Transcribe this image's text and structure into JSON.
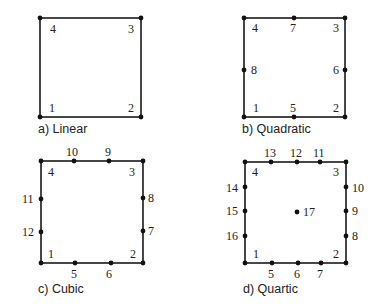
{
  "panels": [
    {
      "id": "linear",
      "caption": "a) Linear",
      "box": {
        "x1": 40,
        "y1": 18,
        "x2": 141,
        "y2": 117
      },
      "caption_pos": {
        "x": 38,
        "y": 133
      },
      "nodes": [
        {
          "label": "1",
          "x": 40,
          "y": 117,
          "lx": 49,
          "ly": 112
        },
        {
          "label": "2",
          "x": 141,
          "y": 117,
          "lx": 128,
          "ly": 112
        },
        {
          "label": "3",
          "x": 141,
          "y": 18,
          "lx": 128,
          "ly": 33
        },
        {
          "label": "4",
          "x": 40,
          "y": 18,
          "lx": 50,
          "ly": 33
        }
      ]
    },
    {
      "id": "quadratic",
      "caption": "b) Quadratic",
      "box": {
        "x1": 244,
        "y1": 18,
        "x2": 345,
        "y2": 117
      },
      "caption_pos": {
        "x": 242,
        "y": 133
      },
      "nodes": [
        {
          "label": "1",
          "x": 244,
          "y": 117,
          "lx": 253,
          "ly": 112
        },
        {
          "label": "2",
          "x": 345,
          "y": 117,
          "lx": 333,
          "ly": 112
        },
        {
          "label": "3",
          "x": 345,
          "y": 18,
          "lx": 333,
          "ly": 32
        },
        {
          "label": "4",
          "x": 244,
          "y": 18,
          "lx": 252,
          "ly": 32
        },
        {
          "label": "5",
          "x": 294,
          "y": 117,
          "lx": 290,
          "ly": 112
        },
        {
          "label": "6",
          "x": 345,
          "y": 70,
          "lx": 333,
          "ly": 74
        },
        {
          "label": "7",
          "x": 294,
          "y": 18,
          "lx": 290,
          "ly": 32
        },
        {
          "label": "8",
          "x": 244,
          "y": 70,
          "lx": 251,
          "ly": 74
        }
      ]
    },
    {
      "id": "cubic",
      "caption": "c) Cubic",
      "box": {
        "x1": 41,
        "y1": 161,
        "x2": 143,
        "y2": 263
      },
      "caption_pos": {
        "x": 38,
        "y": 293
      },
      "nodes": [
        {
          "label": "1",
          "x": 41,
          "y": 263,
          "lx": 48,
          "ly": 258
        },
        {
          "label": "2",
          "x": 143,
          "y": 263,
          "lx": 130,
          "ly": 258
        },
        {
          "label": "3",
          "x": 143,
          "y": 161,
          "lx": 129,
          "ly": 176
        },
        {
          "label": "4",
          "x": 41,
          "y": 161,
          "lx": 48,
          "ly": 176
        },
        {
          "label": "5",
          "x": 75,
          "y": 263,
          "lx": 71,
          "ly": 278
        },
        {
          "label": "6",
          "x": 111,
          "y": 263,
          "lx": 106,
          "ly": 278
        },
        {
          "label": "7",
          "x": 143,
          "y": 231,
          "lx": 148,
          "ly": 235
        },
        {
          "label": "8",
          "x": 143,
          "y": 198,
          "lx": 148,
          "ly": 202
        },
        {
          "label": "9",
          "x": 109,
          "y": 161,
          "lx": 105,
          "ly": 156
        },
        {
          "label": "10",
          "x": 74,
          "y": 161,
          "lx": 66,
          "ly": 156
        },
        {
          "label": "11",
          "x": 41,
          "y": 199,
          "lx": 22,
          "ly": 203
        },
        {
          "label": "12",
          "x": 41,
          "y": 232,
          "lx": 22,
          "ly": 236
        }
      ]
    },
    {
      "id": "quartic",
      "caption": "d) Quartic",
      "box": {
        "x1": 245,
        "y1": 162,
        "x2": 346,
        "y2": 263
      },
      "caption_pos": {
        "x": 243,
        "y": 293
      },
      "nodes": [
        {
          "label": "1",
          "x": 245,
          "y": 263,
          "lx": 253,
          "ly": 258
        },
        {
          "label": "2",
          "x": 346,
          "y": 263,
          "lx": 333,
          "ly": 258
        },
        {
          "label": "3",
          "x": 346,
          "y": 162,
          "lx": 333,
          "ly": 176
        },
        {
          "label": "4",
          "x": 245,
          "y": 162,
          "lx": 252,
          "ly": 176
        },
        {
          "label": "5",
          "x": 272,
          "y": 263,
          "lx": 268,
          "ly": 278
        },
        {
          "label": "6",
          "x": 298,
          "y": 263,
          "lx": 294,
          "ly": 278
        },
        {
          "label": "7",
          "x": 321,
          "y": 263,
          "lx": 317,
          "ly": 278
        },
        {
          "label": "8",
          "x": 346,
          "y": 236,
          "lx": 352,
          "ly": 240
        },
        {
          "label": "9",
          "x": 346,
          "y": 211,
          "lx": 352,
          "ly": 215
        },
        {
          "label": "10",
          "x": 346,
          "y": 187,
          "lx": 352,
          "ly": 192
        },
        {
          "label": "11",
          "x": 320,
          "y": 162,
          "lx": 313,
          "ly": 157
        },
        {
          "label": "12",
          "x": 297,
          "y": 162,
          "lx": 290,
          "ly": 157
        },
        {
          "label": "13",
          "x": 271,
          "y": 162,
          "lx": 264,
          "ly": 157
        },
        {
          "label": "14",
          "x": 245,
          "y": 187,
          "lx": 226,
          "ly": 192
        },
        {
          "label": "15",
          "x": 245,
          "y": 211,
          "lx": 226,
          "ly": 215
        },
        {
          "label": "16",
          "x": 245,
          "y": 236,
          "lx": 226,
          "ly": 240
        },
        {
          "label": "17",
          "x": 297,
          "y": 212,
          "lx": 303,
          "ly": 216
        }
      ]
    }
  ]
}
